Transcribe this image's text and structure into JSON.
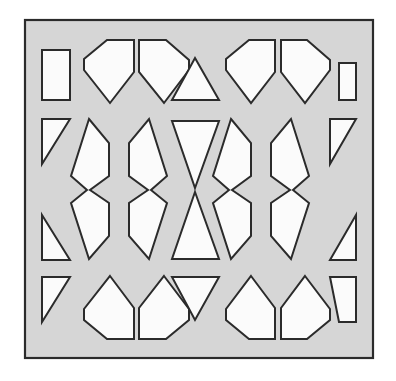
{
  "artwork": {
    "title": "Geometric Perforated Screen Panel",
    "description": "Square decorative jali panel with white cut-out shapes on a gray ground",
    "canvas_width": 396,
    "canvas_height": 381
  },
  "colors": {
    "page_background": "#ffffff",
    "panel_fill": "#d6d6d6",
    "panel_border": "#2b2b2b",
    "cutout_fill": "#fbfbfb",
    "cutout_stroke": "#2b2b2b"
  },
  "frame": {
    "x": 25,
    "y": 20,
    "width": 348,
    "height": 338,
    "border_width": 2.2,
    "label": "panel-frame"
  },
  "grid": {
    "rows": 4,
    "columns": 7,
    "row_labels": [
      "top",
      "upper-middle",
      "lower-middle",
      "bottom"
    ],
    "column_labels": [
      "left-edge",
      "col-2",
      "col-3",
      "center",
      "col-5",
      "col-6",
      "right-edge"
    ]
  },
  "cutouts": [
    {
      "name": "cutout-r1c1-left-half-triangle",
      "row": 1,
      "col": 1,
      "shape": "right-triangle",
      "points": "42,50 70,50 70,100 42,100 42,50"
    },
    {
      "name": "cutout-r1c2-pentagon-point-down",
      "row": 1,
      "col": 2,
      "shape": "pentagon",
      "points": "84,59 107,40 134,40 134,72 110,103 84,70"
    },
    {
      "name": "cutout-r1c3-pentagon-point-down",
      "row": 1,
      "col": 3,
      "shape": "pentagon",
      "points": "139,40 166,40 189,60 189,70 164,103 139,72"
    },
    {
      "name": "cutout-r1c4-triangle-up",
      "row": 1,
      "col": 4,
      "shape": "triangle",
      "points": "195,58 219,100 172,100"
    },
    {
      "name": "cutout-r1c5-pentagon-point-down",
      "row": 1,
      "col": 5,
      "shape": "pentagon",
      "points": "226,59 249,40 275,40 275,72 251,103 226,70"
    },
    {
      "name": "cutout-r1c6-pentagon-point-down",
      "row": 1,
      "col": 6,
      "shape": "pentagon",
      "points": "281,40 307,40 330,60 330,70 305,103 281,72"
    },
    {
      "name": "cutout-r1c7-right-half-triangle",
      "row": 1,
      "col": 7,
      "shape": "right-triangle",
      "points": "339,63 356,63 356,100 339,100"
    },
    {
      "name": "cutout-r2c1-left-half-triangle-down",
      "row": 2,
      "col": 1,
      "shape": "right-triangle",
      "points": "42,119 70,119 42,164"
    },
    {
      "name": "cutout-r2c2-notched-hexagon-left",
      "row": 2,
      "col": 2,
      "shape": "notched-hexagon",
      "points": "89,119 109,143 109,176 90,190 109,203 109,236 89,259 71,203 87,190 71,176"
    },
    {
      "name": "cutout-r2c3-notched-hexagon-right",
      "row": 2,
      "col": 3,
      "shape": "notched-hexagon",
      "points": "149,119 167,176 151,190 167,203 149,259 129,236 129,203 148,190 129,176 129,143"
    },
    {
      "name": "cutout-r2c4-bowtie-upper",
      "row": 2,
      "col": 4,
      "shape": "triangle",
      "points": "172,121 219,121 195,188"
    },
    {
      "name": "cutout-r2c5-notched-hexagon-left",
      "row": 2,
      "col": 5,
      "shape": "notched-hexagon",
      "points": "231,119 251,143 251,176 232,190 251,203 251,236 231,259 213,203 229,190 213,176"
    },
    {
      "name": "cutout-r2c6-notched-hexagon-right",
      "row": 2,
      "col": 6,
      "shape": "notched-hexagon",
      "points": "291,119 309,176 293,190 309,203 291,259 271,236 271,203 290,190 271,176 271,143"
    },
    {
      "name": "cutout-r2c7-right-half-triangle-down",
      "row": 2,
      "col": 7,
      "shape": "right-triangle",
      "points": "330,119 356,119 330,164"
    },
    {
      "name": "cutout-r3c1-left-half-triangle-up",
      "row": 3,
      "col": 1,
      "shape": "right-triangle",
      "points": "42,215 70,260 42,260"
    },
    {
      "name": "cutout-r3c4-bowtie-lower",
      "row": 3,
      "col": 4,
      "shape": "triangle",
      "points": "195,192 219,259 172,259"
    },
    {
      "name": "cutout-r3c7-right-half-triangle-up",
      "row": 3,
      "col": 7,
      "shape": "right-triangle",
      "points": "356,215 356,260 330,260"
    },
    {
      "name": "cutout-r4c1-left-half-triangle-down",
      "row": 4,
      "col": 1,
      "shape": "right-triangle",
      "points": "42,277 70,277 42,322"
    },
    {
      "name": "cutout-r4c2-pentagon-point-up",
      "row": 4,
      "col": 2,
      "shape": "pentagon",
      "points": "110,276 134,308 134,339 107,339 84,320 84,309"
    },
    {
      "name": "cutout-r4c3-pentagon-point-up",
      "row": 4,
      "col": 3,
      "shape": "pentagon",
      "points": "164,276 189,309 189,320 166,339 139,339 139,308"
    },
    {
      "name": "cutout-r4c4-triangle-down",
      "row": 4,
      "col": 4,
      "shape": "triangle",
      "points": "172,277 219,277 195,320"
    },
    {
      "name": "cutout-r4c5-pentagon-point-up",
      "row": 4,
      "col": 5,
      "shape": "pentagon",
      "points": "251,276 275,308 275,339 249,339 226,320 226,309"
    },
    {
      "name": "cutout-r4c6-pentagon-point-up",
      "row": 4,
      "col": 6,
      "shape": "pentagon",
      "points": "305,276 330,309 330,320 307,339 281,339 281,308"
    },
    {
      "name": "cutout-r4c7-right-half-triangle-down",
      "row": 4,
      "col": 7,
      "shape": "right-triangle",
      "points": "330,277 356,277 356,322 339,322"
    }
  ]
}
